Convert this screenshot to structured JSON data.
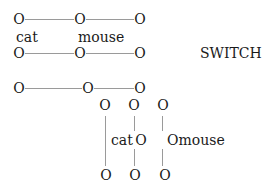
{
  "diagram": {
    "title_label": "SWITCH",
    "node_glyph": "O",
    "line_color": "#9a9a9a",
    "row1": {
      "nodes": [
        "O",
        "O",
        "O"
      ]
    },
    "row1_labels": {
      "left": "cat",
      "right": "mouse"
    },
    "row2": {
      "nodes": [
        "O",
        "O",
        "O"
      ]
    },
    "row3": {
      "nodes": [
        "O",
        "O",
        "O"
      ]
    },
    "vertical": {
      "top_nodes": [
        "O",
        "O",
        "O"
      ],
      "bottom_nodes": [
        "O",
        "O",
        "O"
      ],
      "mid_left_label": "cat",
      "mid_center_node": "O",
      "mid_right_label": "Omouse"
    }
  }
}
